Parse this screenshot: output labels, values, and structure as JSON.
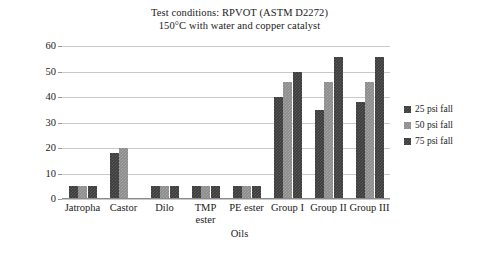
{
  "chart_data": {
    "type": "bar",
    "title": "Test conditions: RPVOT (ASTM D2272)\n150°C with water and copper catalyst",
    "title_lines": [
      "Test conditions: RPVOT (ASTM D2272)",
      "150°C with water and copper catalyst"
    ],
    "xlabel": "Oils",
    "ylabel": "Induction time (min)",
    "categories": [
      "Jatropha",
      "Castor",
      "Dilo",
      "TMP ester",
      "PE ester",
      "Group I",
      "Group II",
      "Group III"
    ],
    "category_lines": [
      [
        "Jatropha"
      ],
      [
        "Castor"
      ],
      [
        "Dilo"
      ],
      [
        "TMP",
        "ester"
      ],
      [
        "PE ester"
      ],
      [
        "Group I"
      ],
      [
        "Group II"
      ],
      [
        "Group III"
      ]
    ],
    "series": [
      {
        "name": "25 psi fall",
        "color": "#3c3c3c",
        "values": [
          5,
          18,
          5,
          5,
          5,
          40,
          35,
          38
        ]
      },
      {
        "name": "50 psi fall",
        "color": "#8c8c8c",
        "values": [
          5,
          20,
          5,
          5,
          5,
          46,
          46,
          46
        ]
      },
      {
        "name": "75 psi fall",
        "color": "#3c3c3c",
        "values": [
          5,
          0,
          5,
          5,
          5,
          50,
          55.5,
          55.5
        ]
      }
    ],
    "ylim": [
      0,
      60
    ],
    "yticks": [
      0,
      10,
      20,
      30,
      40,
      50,
      60
    ],
    "ytick_labels": [
      "0",
      "10",
      "20",
      "30",
      "40",
      "50",
      "60"
    ],
    "grid": true,
    "legend_position": "right",
    "legend": [
      "25 psi fall",
      "50 psi fall",
      "75 psi fall"
    ]
  }
}
